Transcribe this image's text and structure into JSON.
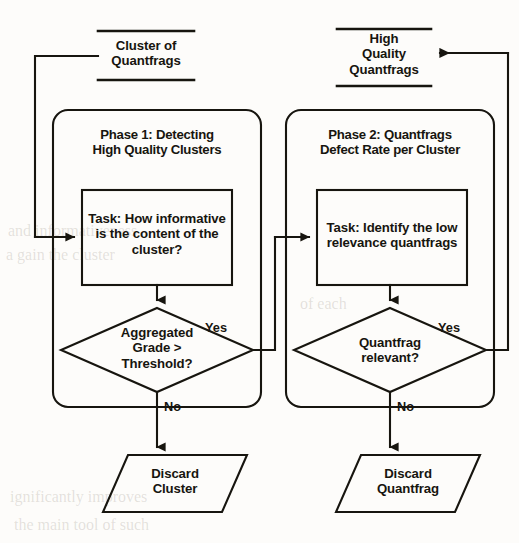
{
  "diagram": {
    "background_color": "#fdfcfa",
    "line_color": "#17150f",
    "text_color": "#17150f"
  },
  "inputs": {
    "cluster_of_quantfrags": {
      "line1": "Cluster of",
      "line2": "Quantfrags"
    },
    "high_quality_quantfrags": {
      "line1": "High",
      "line2": "Quality",
      "line3": "Quantfrags"
    }
  },
  "phases": [
    {
      "id": "phase-1",
      "title_line1": "Phase 1: Detecting",
      "title_line2": "High Quality Clusters",
      "task": {
        "line1": "Task: How informative",
        "line2": "is the content of the",
        "line3": "cluster?"
      },
      "decision": {
        "line1": "Aggregated",
        "line2": "Grade >",
        "line3": "Threshold?",
        "yes_label": "Yes",
        "no_label": "No"
      },
      "terminal": {
        "line1": "Discard",
        "line2": "Cluster"
      }
    },
    {
      "id": "phase-2",
      "title_line1": "Phase 2: Quantfrags",
      "title_line2": "Defect Rate per Cluster",
      "task": {
        "line1": "Task: Identify the low",
        "line2": "relevance quantfrags"
      },
      "decision": {
        "line1": "Quantfrag",
        "line2": "relevant?",
        "yes_label": "Yes",
        "no_label": "No"
      },
      "terminal": {
        "line1": "Discard",
        "line2": "Quantfrag"
      }
    }
  ],
  "bleed_through": {
    "l1": "and informativeness",
    "l2": "a gain the cluster",
    "l3": "of each",
    "l4": "ignificantly improves",
    "l5": "the main tool of such"
  }
}
